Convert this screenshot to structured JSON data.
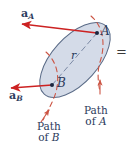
{
  "figure": {
    "background_color": "#ffffff",
    "body_fill_color": "#ccd5e4",
    "body_stroke_color": "#5a6b87",
    "vector_color": "#cc2222",
    "path_color": "#cc5544",
    "label_color": "#2b3a5c",
    "r_line_color": "#7c8aa5"
  },
  "labels": {
    "accel_a_main": "a",
    "accel_a_sub": "A",
    "accel_b_main": "a",
    "accel_b_sub": "B",
    "point_a": "A",
    "point_b": "B",
    "radius": "r",
    "path_of_a_line1": "Path",
    "path_of_a_line2_prefix": "of",
    "path_of_a_line2_point": "A",
    "path_of_b_line1": "Path",
    "path_of_b_line2_prefix": "of",
    "path_of_b_line2_point": "B",
    "equals_sign": "="
  },
  "geometry": {
    "point_a": {
      "x": 97,
      "y": 33
    },
    "point_b": {
      "x": 52,
      "y": 85
    },
    "vector_a_tip": {
      "x": 20,
      "y": 24
    },
    "vector_b_tip": {
      "x": 9,
      "y": 88
    },
    "body_center": {
      "x": 75,
      "y": 60
    },
    "body_rx": 46,
    "body_ry": 23,
    "body_rotation_deg": -48
  }
}
